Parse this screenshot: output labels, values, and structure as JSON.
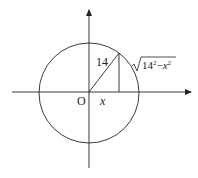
{
  "diagram": {
    "type": "unit-circle-style geometry figure",
    "colors": {
      "stroke": "#222222",
      "background": "#ffffff"
    },
    "labels": {
      "radius": "14",
      "origin": "O",
      "x_segment": "x",
      "height_radicand_base": "14",
      "height_radicand_exp": "2",
      "height_minus": "−",
      "height_var": "x",
      "height_var_exp": "2"
    },
    "elements": {
      "circle": {
        "cx": 89,
        "cy": 93,
        "r": 50
      },
      "x_axis": {
        "x1": 12,
        "x2": 193,
        "y": 92,
        "arrow": "right"
      },
      "y_axis": {
        "x": 89,
        "y1": 168,
        "y2": 8,
        "arrow": "up"
      },
      "radius_segment": {
        "from": [
          89,
          92
        ],
        "to": [
          119,
          53
        ]
      },
      "vertical_segment": {
        "from": [
          119,
          53
        ],
        "to": [
          119,
          92
        ]
      }
    }
  }
}
